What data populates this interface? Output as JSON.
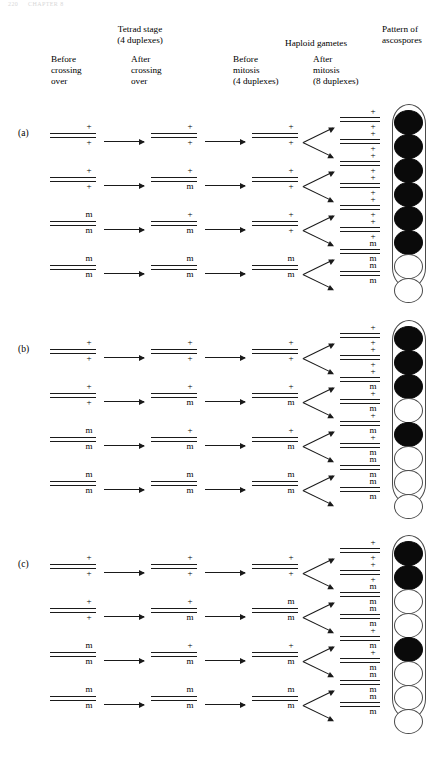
{
  "running_head": {
    "page": "220",
    "title": "CHAPTER 8"
  },
  "headers": {
    "group_tetrad": "Tetrad stage\n(4 duplexes)",
    "group_tetrad_line1": "Tetrad stage",
    "group_tetrad_line2": "(4 duplexes)",
    "group_haploid": "Haploid gametes",
    "group_pattern_line1": "Pattern of",
    "group_pattern_line2": "ascospores",
    "sub_before_crossing_over": "Before\ncrossing\nover",
    "sub_after_crossing_over": "After\ncrossing\nover",
    "sub_before_mitosis_line1": "Before",
    "sub_before_mitosis_line2": "mitosis",
    "sub_before_mitosis_line3": "(4 duplexes)",
    "sub_after_mitosis_line1": "After",
    "sub_after_mitosis_line2": "mitosis",
    "sub_after_mitosis_line3": "(8 duplexes)"
  },
  "allele_symbols": {
    "wild_type": "+",
    "mutant": "m"
  },
  "colors": {
    "line": "#1a1a1a",
    "spore_outline": "#4a4a4a",
    "spore_filled": "#0a0a0a",
    "spore_empty": "#ffffff",
    "background": "#ffffff"
  },
  "sections": [
    {
      "id": "a",
      "label": "(a)",
      "rows": [
        {
          "before_crossing_over": {
            "up": "+",
            "down": "+"
          },
          "after_crossing_over": {
            "up": "+",
            "down": "+"
          },
          "before_mitosis": {
            "up": "+",
            "down": "+"
          },
          "after_mitosis": [
            {
              "up": "+",
              "down": "+"
            },
            {
              "up": "+",
              "down": "+"
            }
          ]
        },
        {
          "before_crossing_over": {
            "up": "+",
            "down": "+"
          },
          "after_crossing_over": {
            "up": "+",
            "down": "m"
          },
          "before_mitosis": {
            "up": "+",
            "down": "+"
          },
          "after_mitosis": [
            {
              "up": "+",
              "down": "+"
            },
            {
              "up": "+",
              "down": "+"
            }
          ]
        },
        {
          "before_crossing_over": {
            "up": "m",
            "down": "m"
          },
          "after_crossing_over": {
            "up": "+",
            "down": "m"
          },
          "before_mitosis": {
            "up": "+",
            "down": "+"
          },
          "after_mitosis": [
            {
              "up": "+",
              "down": "+"
            },
            {
              "up": "+",
              "down": "+"
            }
          ]
        },
        {
          "before_crossing_over": {
            "up": "m",
            "down": "m"
          },
          "after_crossing_over": {
            "up": "m",
            "down": "m"
          },
          "before_mitosis": {
            "up": "m",
            "down": "m"
          },
          "after_mitosis": [
            {
              "up": "m",
              "down": "m"
            },
            {
              "up": "m",
              "down": "m"
            }
          ]
        }
      ],
      "ascospores": [
        "filled",
        "filled",
        "filled",
        "filled",
        "filled",
        "filled",
        "empty",
        "empty"
      ]
    },
    {
      "id": "b",
      "label": "(b)",
      "rows": [
        {
          "before_crossing_over": {
            "up": "+",
            "down": "+"
          },
          "after_crossing_over": {
            "up": "+",
            "down": "+"
          },
          "before_mitosis": {
            "up": "+",
            "down": "+"
          },
          "after_mitosis": [
            {
              "up": "+",
              "down": "+"
            },
            {
              "up": "+",
              "down": "+"
            }
          ]
        },
        {
          "before_crossing_over": {
            "up": "+",
            "down": "+"
          },
          "after_crossing_over": {
            "up": "+",
            "down": "m"
          },
          "before_mitosis": {
            "up": "+",
            "down": "m"
          },
          "after_mitosis": [
            {
              "up": "+",
              "down": "m"
            },
            {
              "up": "+",
              "down": "m"
            }
          ]
        },
        {
          "before_crossing_over": {
            "up": "m",
            "down": "m"
          },
          "after_crossing_over": {
            "up": "+",
            "down": "m"
          },
          "before_mitosis": {
            "up": "+",
            "down": "m"
          },
          "after_mitosis": [
            {
              "up": "+",
              "down": "m"
            },
            {
              "up": "+",
              "down": "m"
            }
          ]
        },
        {
          "before_crossing_over": {
            "up": "m",
            "down": "m"
          },
          "after_crossing_over": {
            "up": "m",
            "down": "m"
          },
          "before_mitosis": {
            "up": "m",
            "down": "m"
          },
          "after_mitosis": [
            {
              "up": "m",
              "down": "m"
            },
            {
              "up": "m",
              "down": "m"
            }
          ]
        }
      ],
      "ascospores": [
        "filled",
        "filled",
        "filled",
        "empty",
        "filled",
        "empty",
        "empty",
        "empty"
      ]
    },
    {
      "id": "c",
      "label": "(c)",
      "rows": [
        {
          "before_crossing_over": {
            "up": "+",
            "down": "+"
          },
          "after_crossing_over": {
            "up": "+",
            "down": "+"
          },
          "before_mitosis": {
            "up": "+",
            "down": "+"
          },
          "after_mitosis": [
            {
              "up": "+",
              "down": "+"
            },
            {
              "up": "+",
              "down": "+"
            }
          ]
        },
        {
          "before_crossing_over": {
            "up": "+",
            "down": "+"
          },
          "after_crossing_over": {
            "up": "+",
            "down": "m"
          },
          "before_mitosis": {
            "up": "m",
            "down": "m"
          },
          "after_mitosis": [
            {
              "up": "m",
              "down": "m"
            },
            {
              "up": "m",
              "down": "m"
            }
          ]
        },
        {
          "before_crossing_over": {
            "up": "m",
            "down": "m"
          },
          "after_crossing_over": {
            "up": "+",
            "down": "m"
          },
          "before_mitosis": {
            "up": "+",
            "down": "m"
          },
          "after_mitosis": [
            {
              "up": "+",
              "down": "m"
            },
            {
              "up": "+",
              "down": "m"
            }
          ]
        },
        {
          "before_crossing_over": {
            "up": "m",
            "down": "m"
          },
          "after_crossing_over": {
            "up": "m",
            "down": "m"
          },
          "before_mitosis": {
            "up": "m",
            "down": "m"
          },
          "after_mitosis": [
            {
              "up": "m",
              "down": "m"
            },
            {
              "up": "m",
              "down": "m"
            }
          ]
        }
      ],
      "ascospores": [
        "filled",
        "filled",
        "empty",
        "empty",
        "filled",
        "empty",
        "empty",
        "empty"
      ]
    }
  ]
}
